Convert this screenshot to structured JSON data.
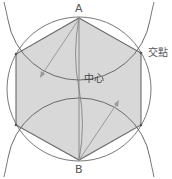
{
  "diagram": {
    "title": "",
    "labels": {
      "point_a": "A",
      "point_b": "B",
      "center": "中心",
      "intersection": "交點"
    },
    "colors": {
      "hexagon_fill": "#d8d8d8",
      "stroke": "#6a6a6a",
      "arrow": "#9a9a9a",
      "background": "#ffffff"
    },
    "geometry": {
      "circle_center": [
        79,
        89
      ],
      "circle_radius": 72,
      "vertices": {
        "A": [
          79,
          18
        ],
        "top_right": [
          141,
          53
        ],
        "bottom_right": [
          141,
          125
        ],
        "B": [
          79,
          160
        ],
        "bottom_left": [
          16,
          125
        ],
        "top_left": [
          16,
          54
        ]
      }
    }
  }
}
